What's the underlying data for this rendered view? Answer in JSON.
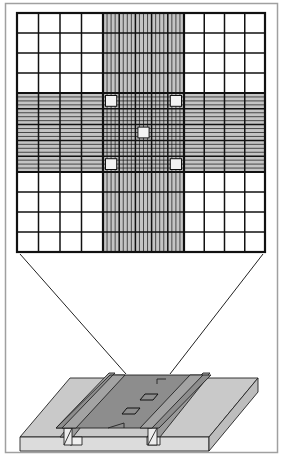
{
  "diagram": {
    "subject": "Hemocytometer counting chamber",
    "description": "Magnified counting grid above a counting chamber slide with coverslip",
    "grid": {
      "outer_cols_left": 4,
      "outer_cols_right": 4,
      "outer_rows_top": 4,
      "outer_rows_bottom": 4,
      "central_squares": 5,
      "subdivisions_per_central_square": 4,
      "highlighted_squares": [
        "top-left",
        "top-right",
        "center",
        "bottom-left",
        "bottom-right"
      ]
    },
    "colors": {
      "frame": "#a0a0a0",
      "grid_line": "#111111",
      "band_fill": "#c4c4c4",
      "center_fill": "#bdbdbd",
      "highlight_fill": "#f2f2f2",
      "slide_top": "#c9c9c9",
      "slide_side": "#dcdcdc",
      "coverslip": "#8d8d8d",
      "rail": "#a9a9a9"
    }
  }
}
